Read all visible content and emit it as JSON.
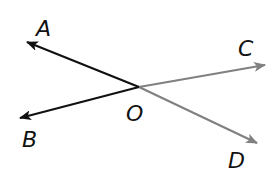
{
  "diagram": {
    "type": "rays-from-point",
    "vertex": {
      "label": "O",
      "x": 139,
      "y": 87,
      "label_x": 132,
      "label_y": 121
    },
    "colors": {
      "dark_ray": "#111111",
      "light_ray": "#808080",
      "label": "#111111",
      "background": "#ffffff"
    },
    "rays": [
      {
        "id": "OA",
        "label": "A",
        "tip_x": 27,
        "tip_y": 42,
        "label_x": 36,
        "label_y": 36,
        "color": "#111111"
      },
      {
        "id": "OB",
        "label": "B",
        "tip_x": 20,
        "tip_y": 118,
        "label_x": 22,
        "label_y": 147,
        "color": "#111111"
      },
      {
        "id": "OC",
        "label": "C",
        "tip_x": 265,
        "tip_y": 65,
        "label_x": 238,
        "label_y": 56,
        "color": "#808080"
      },
      {
        "id": "OD",
        "label": "D",
        "tip_x": 257,
        "tip_y": 143,
        "label_x": 228,
        "label_y": 168,
        "color": "#808080"
      }
    ]
  }
}
